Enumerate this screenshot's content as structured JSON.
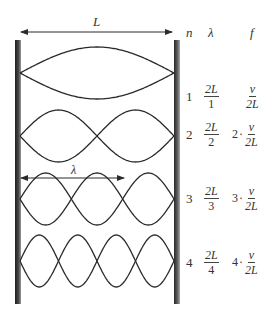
{
  "diagram": {
    "length_label": "L",
    "wavelength_label": "λ",
    "headers": {
      "n": "n",
      "lambda": "λ",
      "f": "f"
    },
    "rows": [
      {
        "n": "1",
        "lambda_num": "2L",
        "lambda_den": "1",
        "f_coef": "",
        "f_num": "v",
        "f_den": "2L"
      },
      {
        "n": "2",
        "lambda_num": "2L",
        "lambda_den": "2",
        "f_coef": "2",
        "f_num": "v",
        "f_den": "2L"
      },
      {
        "n": "3",
        "lambda_num": "2L",
        "lambda_den": "3",
        "f_coef": "3",
        "f_num": "v",
        "f_den": "2L"
      },
      {
        "n": "4",
        "lambda_num": "2L",
        "lambda_den": "4",
        "f_coef": "4",
        "f_num": "v",
        "f_den": "2L"
      }
    ],
    "dot_symbol": "·",
    "colors": {
      "stroke": "#2a2a2a",
      "wall": "#3a3a3a",
      "text": "#333333"
    }
  }
}
